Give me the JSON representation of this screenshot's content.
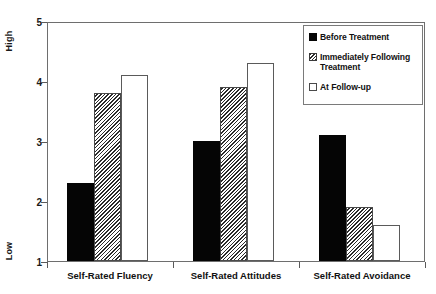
{
  "chart_data": {
    "type": "bar",
    "title": "",
    "xlabel": "",
    "ylabel": "",
    "ylim": [
      1,
      5
    ],
    "yticks": [
      "1",
      "2",
      "3",
      "4",
      "5"
    ],
    "grid": false,
    "legend_position": "upper right",
    "axis_endpoint_labels": {
      "high": "High",
      "low": "Low"
    },
    "categories": [
      "Self-Rated Fluency",
      "Self-Rated Attitudes",
      "Self-Rated Avoidance"
    ],
    "series": [
      {
        "name": "Before Treatment",
        "fill": "solid",
        "values": [
          2.3,
          3.0,
          3.1
        ]
      },
      {
        "name": "Immediately Following Treatment",
        "fill": "hatched",
        "values": [
          3.8,
          3.9,
          1.9
        ]
      },
      {
        "name": "At Follow-up",
        "fill": "open",
        "values": [
          4.1,
          4.3,
          1.6
        ]
      }
    ]
  },
  "legend": {
    "entries": [
      "Before Treatment",
      "Immediately Following Treatment",
      "At Follow-up"
    ]
  },
  "colors": {
    "solid": "#050505",
    "hatch_line": "#2b2b2b",
    "open": "#ffffff",
    "frame": "#6e6e6e",
    "text": "#111111"
  }
}
